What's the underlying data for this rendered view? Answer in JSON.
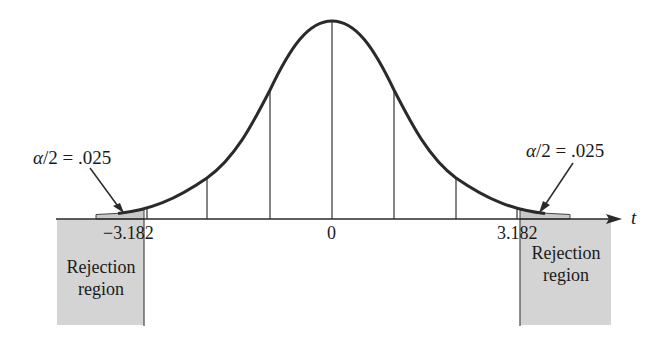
{
  "diagram": {
    "type": "t-distribution two-tailed rejection regions",
    "axis_label": "t",
    "ticks": {
      "left_critical": "−3.182",
      "center": "0",
      "right_critical": "3.182"
    },
    "annotations": {
      "left_alpha_symbol": "α",
      "left_alpha_rest": "/2 = .025",
      "right_alpha_symbol": "α",
      "right_alpha_rest": "/2 = .025"
    },
    "regions": {
      "left_line1": "Rejection",
      "left_line2": "region",
      "right_line1": "Rejection",
      "right_line2": "region"
    },
    "colors": {
      "curve": "#2a2a2a",
      "region_fill": "#d4d4d4",
      "axis": "#2a2a2a"
    }
  }
}
